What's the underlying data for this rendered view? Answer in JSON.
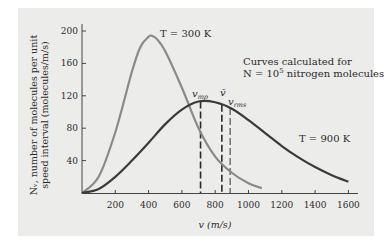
{
  "chart_data": {
    "type": "line",
    "title": "",
    "xlabel": "v (m/s)",
    "ylabel": "N_v, number of molecules per unit speed interval (molecules/m/s)",
    "ylabel_lines": [
      "Nᵥ, number of molecules per unit",
      "speed interval (molecules/m/s)"
    ],
    "xlim": [
      0,
      1650
    ],
    "ylim": [
      0,
      210
    ],
    "x_ticks": [
      200,
      400,
      600,
      800,
      1000,
      1200,
      1400,
      1600
    ],
    "x_tick_labels": [
      "200",
      "400",
      "600",
      "800",
      "1000",
      "1200",
      "1400",
      "1600"
    ],
    "y_ticks": [
      40,
      80,
      120,
      160,
      200
    ],
    "y_tick_labels": [
      "40",
      "80",
      "120",
      "160",
      "200"
    ],
    "grid": false,
    "series": [
      {
        "name": "T = 300 K",
        "color": "#8a8a8a",
        "x": [
          0,
          100,
          200,
          300,
          350,
          400,
          420,
          450,
          500,
          600,
          700,
          800,
          900,
          1000,
          1080
        ],
        "y": [
          0,
          20,
          75,
          150,
          180,
          193,
          194,
          190,
          175,
          130,
          80,
          45,
          25,
          12,
          6
        ]
      },
      {
        "name": "T = 900 K",
        "color": "#3a3a3a",
        "x": [
          0,
          100,
          200,
          300,
          400,
          500,
          600,
          700,
          800,
          900,
          1000,
          1100,
          1200,
          1300,
          1400,
          1500,
          1600
        ],
        "y": [
          0,
          5,
          20,
          40,
          62,
          85,
          103,
          113,
          112,
          104,
          90,
          74,
          58,
          44,
          32,
          22,
          14
        ]
      }
    ],
    "annotations": [
      {
        "text": "T = 300 K",
        "x": 470,
        "y": 194
      },
      {
        "text": "T = 900 K",
        "x": 1320,
        "y": 60
      },
      {
        "text": "Curves calculated for",
        "x": 890,
        "y": 168
      },
      {
        "text": "N = 10^5 nitrogen molecules",
        "x": 890,
        "y": 153
      }
    ],
    "vertical_markers": [
      {
        "label": "v_mp",
        "x": 712,
        "style": "dashed",
        "color": "#2b2b2b"
      },
      {
        "label": "v̄",
        "x": 840,
        "style": "dashed",
        "color": "#2b2b2b"
      },
      {
        "label": "v_rms",
        "x": 890,
        "style": "dashed",
        "color": "#777777"
      }
    ]
  },
  "labels": {
    "ylabel_line1": "Nᵥ, number of molecules per unit",
    "ylabel_line2": "speed interval (molecules/m/s)",
    "xlabel": "v (m/s)",
    "t300": "T = 300 K",
    "t900": "T = 900 K",
    "note1": "Curves calculated for",
    "note2_prefix": "N = 10",
    "note2_exp": "5",
    "note2_suffix": " nitrogen molecules",
    "vmp": "v",
    "vmp_sub": "mp",
    "vbar": "v̄",
    "vrms": "v",
    "vrms_sub": "rms"
  }
}
